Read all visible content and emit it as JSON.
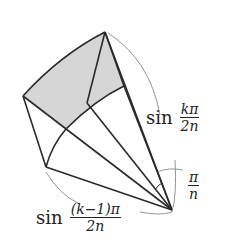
{
  "diagram": {
    "type": "geometric-figure",
    "labels": {
      "upper_right": {
        "func": "sin",
        "numerator": "kπ",
        "denominator": "2n"
      },
      "angle": {
        "numerator": "π",
        "denominator": "n"
      },
      "bottom_left": {
        "func": "sin",
        "numerator": "(k−1)π",
        "denominator": "2n"
      }
    },
    "colors": {
      "stroke": "#2a2a2a",
      "shade": "#d6d6d6",
      "arc": "#777777"
    }
  }
}
